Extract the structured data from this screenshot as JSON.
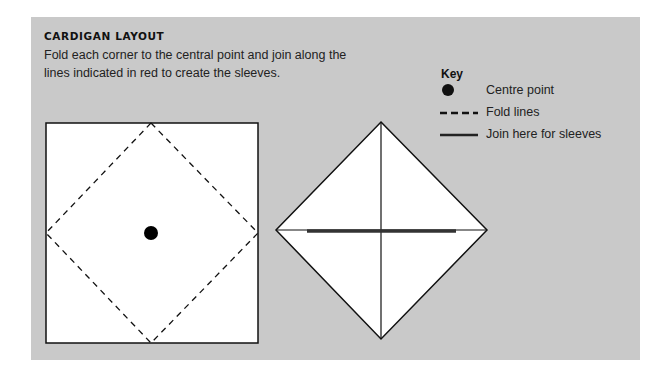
{
  "title": "CARDIGAN LAYOUT",
  "description": "Fold each corner to the central point and join along the lines indicated in red to create the sleeves.",
  "key": {
    "title": "Key",
    "items": [
      {
        "icon": "centre-point-dot",
        "label": "Centre point"
      },
      {
        "icon": "dashed-line",
        "label": "Fold lines"
      },
      {
        "icon": "solid-line",
        "label": "Join here for sleeves"
      }
    ]
  },
  "colors": {
    "panel": "#c9c9c9",
    "shape_fill": "#ffffff",
    "stroke": "#111111",
    "join_line": "#333333"
  }
}
